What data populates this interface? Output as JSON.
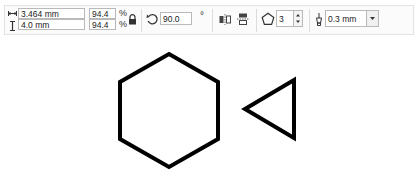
{
  "toolbar": {
    "object_size": {
      "width": "3.464 mm",
      "height": "4.0 mm",
      "width_icon": "width-arrows-icon",
      "height_icon": "height-arrows-icon"
    },
    "scale": {
      "width_percent": "94.4",
      "height_percent": "94.4",
      "unit": "%",
      "lock_icon": "lock-icon"
    },
    "rotation": {
      "icon": "rotate-icon",
      "angle": "90.0",
      "unit": "°"
    },
    "mirror": {
      "horizontal_icon": "mirror-horizontal-icon",
      "vertical_icon": "mirror-vertical-icon"
    },
    "polygon": {
      "icon": "pentagon-icon",
      "points": "3"
    },
    "outline": {
      "icon": "pen-nib-icon",
      "width": "0.3 mm"
    }
  },
  "canvas": {
    "shapes": [
      {
        "type": "hexagon",
        "stroke": "#000000"
      },
      {
        "type": "triangle",
        "stroke": "#000000"
      }
    ]
  }
}
